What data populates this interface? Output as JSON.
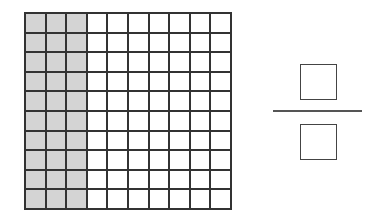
{
  "diagram": {
    "type": "hundred-grid-fraction",
    "grid": {
      "rows": 10,
      "columns": 10,
      "shaded_columns": 3,
      "shaded_cells": 30,
      "total_cells": 100,
      "shade_color": "#d4d4d4",
      "line_color": "#333333"
    },
    "fraction": {
      "numerator": "",
      "denominator": "",
      "numerator_placeholder": "empty-box",
      "denominator_placeholder": "empty-box"
    }
  }
}
